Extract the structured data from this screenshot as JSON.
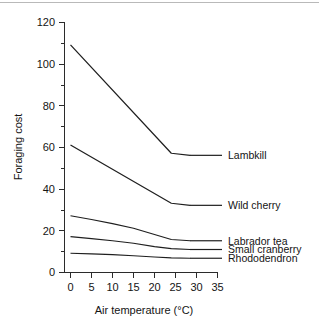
{
  "chart_data": {
    "type": "line",
    "title": "",
    "xlabel": "Air temperature (°C)",
    "ylabel": "Foraging cost",
    "xlim": [
      0,
      35
    ],
    "ylim": [
      0,
      120
    ],
    "xticks": [
      0,
      5,
      10,
      15,
      20,
      25,
      30,
      35
    ],
    "xtick_labels": [
      "0",
      "5",
      "10",
      "15",
      "20",
      "25",
      "30",
      "35"
    ],
    "yticks": [
      0,
      20,
      40,
      60,
      80,
      100,
      120
    ],
    "ytick_labels": [
      "0",
      "20",
      "40",
      "60",
      "80",
      "100",
      "120"
    ],
    "yticks_minor": [
      10,
      30,
      50,
      70,
      90,
      110
    ],
    "grid": false,
    "legend_position": "right-inline-labels",
    "series": [
      {
        "name": "Lambkill",
        "label": "Lambkill",
        "color": "#1f1f1f",
        "x": [
          0,
          24,
          28.5
        ],
        "y": [
          109,
          57,
          56
        ],
        "label_x": 28.5,
        "label_y": 56
      },
      {
        "name": "Wild cherry",
        "label": "Wild cherry",
        "color": "#1f1f1f",
        "x": [
          0,
          24,
          28.5
        ],
        "y": [
          61,
          33,
          32
        ],
        "label_x": 28.5,
        "label_y": 32
      },
      {
        "name": "Labrador tea",
        "label": "Labrador tea",
        "color": "#1f1f1f",
        "x": [
          0,
          5,
          10,
          15,
          20,
          24,
          28.5
        ],
        "y": [
          27,
          25.2,
          23.2,
          21,
          18,
          15.6,
          15
        ],
        "label_x": 28.5,
        "label_y": 15
      },
      {
        "name": "Small cranberry",
        "label": "Small cranberry",
        "color": "#1f1f1f",
        "x": [
          0,
          5,
          10,
          15,
          20,
          24,
          28.5
        ],
        "y": [
          17,
          16,
          15,
          13.8,
          12.2,
          11.2,
          10.8
        ],
        "label_x": 28.5,
        "label_y": 10.8
      },
      {
        "name": "Rhododendron",
        "label": "Rhododendron",
        "color": "#1f1f1f",
        "x": [
          0,
          5,
          10,
          15,
          20,
          24,
          28.5
        ],
        "y": [
          9,
          8.7,
          8.3,
          7.8,
          7.2,
          6.8,
          6.6
        ],
        "label_x": 28.5,
        "label_y": 6.6
      }
    ]
  },
  "axes": {
    "x_title": "Air temperature (°C)",
    "y_title": "Foraging cost"
  },
  "labels": {
    "lambkill": "Lambkill",
    "wild_cherry": "Wild cherry",
    "labrador_tea": "Labrador tea",
    "small_cranberry": "Small cranberry",
    "rhododendron": "Rhododendron"
  },
  "yticks": {
    "t0": "0",
    "t20": "20",
    "t40": "40",
    "t60": "60",
    "t80": "80",
    "t100": "100",
    "t120": "120"
  },
  "xticks": {
    "t0": "0",
    "t5": "5",
    "t10": "10",
    "t15": "15",
    "t20": "20",
    "t25": "25",
    "t30": "30",
    "t35": "35"
  }
}
